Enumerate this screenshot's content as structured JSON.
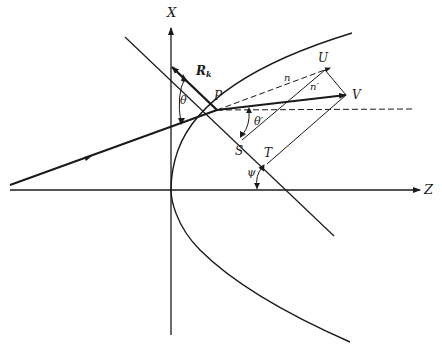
{
  "diagram": {
    "type": "geometric-optics",
    "colors": {
      "line": "#1a1a1a",
      "background": "#ffffff"
    },
    "axes": {
      "x_label": "X",
      "z_label": "Z"
    },
    "points": {
      "P": "P",
      "U": "U",
      "V": "V",
      "S": "S",
      "T": "T"
    },
    "vectors": {
      "normal_main": "R",
      "normal_sub": "k",
      "n": "n",
      "n_prime": "n′"
    },
    "angles": {
      "theta": "θ",
      "theta_prime": "θ′",
      "psi": "ψ"
    }
  }
}
